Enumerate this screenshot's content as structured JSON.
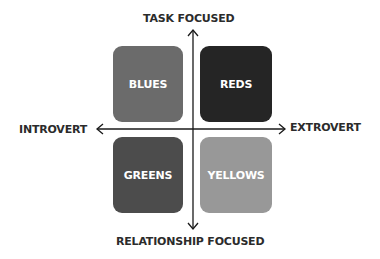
{
  "axes": {
    "top": "TASK FOCUSED",
    "bottom": "RELATIONSHIP FOCUSED",
    "left": "INTROVERT",
    "right": "EXTROVERT"
  },
  "quadrants": [
    {
      "label": "BLUES",
      "position": "top-left",
      "color": "#6b6b6b"
    },
    {
      "label": "REDS",
      "position": "top-right",
      "color": "#252525"
    },
    {
      "label": "GREENS",
      "position": "bottom-left",
      "color": "#4c4c4c"
    },
    {
      "label": "YELLOWS",
      "position": "bottom-right",
      "color": "#989898"
    }
  ]
}
